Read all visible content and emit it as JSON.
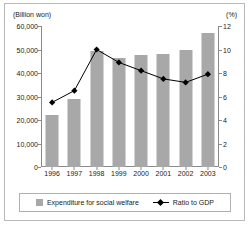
{
  "chart_data": {
    "type": "bar",
    "title": "",
    "subtitle": "",
    "categories": [
      "1996",
      "1997",
      "1998",
      "1999",
      "2000",
      "2001",
      "2002",
      "2003"
    ],
    "xlabel": "",
    "series": [
      {
        "name": "Expenditure for social welfare",
        "type": "bar",
        "axis": "left",
        "unit": "Billion won",
        "color": "#a8a8a8",
        "values": [
          22000,
          29000,
          49500,
          46500,
          47500,
          48000,
          49700,
          57000
        ]
      },
      {
        "name": "Ratio to GDP",
        "type": "line",
        "axis": "right",
        "unit": "%",
        "color": "#000000",
        "marker": "diamond",
        "values": [
          5.5,
          6.5,
          10.0,
          8.9,
          8.2,
          7.5,
          7.2,
          7.9
        ]
      }
    ],
    "axes": {
      "left": {
        "unit_label": "(Billion won)",
        "ylabel": "Billion won",
        "ylim": [
          0,
          60000
        ],
        "tick_step": 10000,
        "ticks": [
          0,
          10000,
          20000,
          30000,
          40000,
          50000,
          60000
        ],
        "tick_labels": [
          "0",
          "10,000",
          "20,000",
          "30,000",
          "40,000",
          "50,000",
          "60,000"
        ]
      },
      "right": {
        "unit_label": "(%)",
        "ylabel": "%",
        "ylim": [
          0,
          12
        ],
        "tick_step": 2,
        "ticks": [
          0,
          2,
          4,
          6,
          8,
          10,
          12
        ],
        "tick_labels": [
          "0",
          "2",
          "4",
          "6",
          "8",
          "10",
          "12"
        ]
      }
    },
    "grid": false,
    "legend": {
      "position": "bottom",
      "entries": [
        {
          "label": "Expenditure for social welfare",
          "marker": "square",
          "color": "#a8a8a8"
        },
        {
          "label": "Ratio to GDP",
          "marker": "line-diamond",
          "color": "#000000"
        }
      ]
    }
  }
}
